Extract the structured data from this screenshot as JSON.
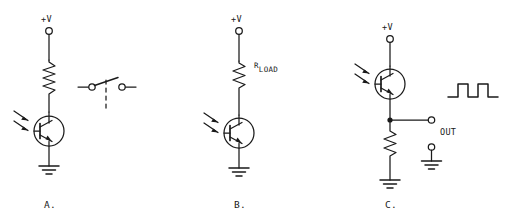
{
  "figure": {
    "background_color": "#ffffff",
    "line_color": "#1a1a1a"
  },
  "circuits": [
    {
      "id": "a",
      "panel_label": "A.",
      "supply_label": "+V",
      "description": "Phototransistor driving a relay coil with switch contacts",
      "components": [
        "supply-terminal",
        "relay-coil",
        "phototransistor-npn",
        "ground",
        "relay-switch-contacts"
      ],
      "light_arrows": 2
    },
    {
      "id": "b",
      "panel_label": "B.",
      "supply_label": "+V",
      "resistor_label_main": "R",
      "resistor_label_sub": "LOAD",
      "description": "Phototransistor with load resistor in collector",
      "components": [
        "supply-terminal",
        "load-resistor",
        "phototransistor-npn",
        "ground"
      ],
      "light_arrows": 2
    },
    {
      "id": "c",
      "panel_label": "C.",
      "supply_label": "+V",
      "output_label": "OUT",
      "description": "Phototransistor emitter follower with square wave output",
      "components": [
        "supply-terminal",
        "phototransistor-npn",
        "junction-dot",
        "emitter-resistor",
        "ground",
        "output-terminal",
        "ground-return-terminal",
        "square-wave"
      ],
      "light_arrows": 2,
      "waveform": {
        "type": "square",
        "pulses": 2
      }
    }
  ]
}
